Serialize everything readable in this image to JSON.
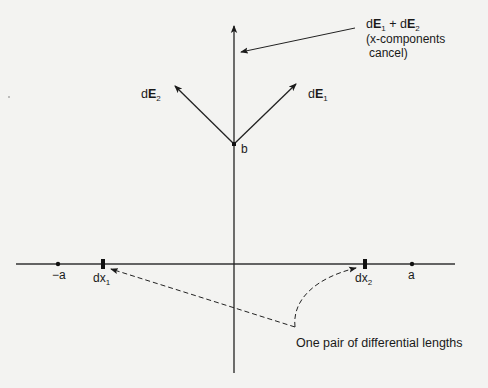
{
  "figure": {
    "type": "electric field diagram",
    "colors": {
      "background": "#f3f3f1",
      "ink": "#1a1a1a"
    }
  },
  "labels": {
    "sum": {
      "d1": "d",
      "E1": "E",
      "s1": "1",
      "plus": " + ",
      "d2": "d",
      "E2": "E",
      "s2": "2"
    },
    "sum_note_line1": "(x-components",
    "sum_note_line2": "cancel)",
    "dE2": {
      "d": "d",
      "E": "E",
      "sub": "2"
    },
    "dE1": {
      "d": "d",
      "E": "E",
      "sub": "1"
    },
    "point_b": "b",
    "neg_a": "−a",
    "pos_a": "a",
    "dx1": {
      "base": "dx",
      "sub": "1"
    },
    "dx2": {
      "base": "dx",
      "sub": "2"
    },
    "pair_note": "One pair of differential lengths"
  }
}
